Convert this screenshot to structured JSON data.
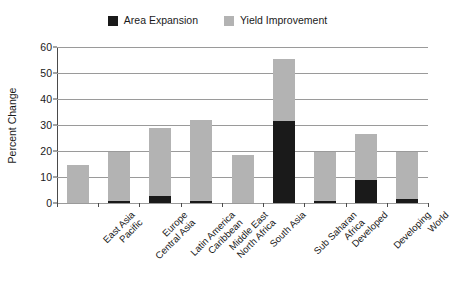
{
  "chart_data": {
    "type": "bar",
    "subtype": "stacked-vertical-bar",
    "title": "",
    "subtitle": "",
    "xlabel": "",
    "ylabel": "Percent Change",
    "ylim": [
      0,
      60
    ],
    "ytick_step": 10,
    "ytick_labels": [
      "60",
      "50",
      "40",
      "30",
      "20",
      "10",
      "0"
    ],
    "ytick_values": [
      60,
      50,
      40,
      30,
      20,
      10,
      0
    ],
    "grid": "horizontal",
    "legend_position": "top-center",
    "categories": [
      "East Asia Pacific",
      "Europe Central Asia",
      "Latin America Caribbean",
      "Middle East North Africa",
      "South Asia",
      "Sub Saharan Africa",
      "Developed",
      "Developing",
      "World"
    ],
    "category_lines": [
      [
        "East Asia",
        "Pacific"
      ],
      [
        "Europe",
        "Central Asia"
      ],
      [
        "Latin America",
        "Caribbean"
      ],
      [
        "Middle East",
        "North Africa"
      ],
      [
        "South Asia",
        ""
      ],
      [
        "Sub Saharan",
        "Africa"
      ],
      [
        "Developed",
        ""
      ],
      [
        "Developing",
        ""
      ],
      [
        "World",
        ""
      ]
    ],
    "series": [
      {
        "name": "Area Expansion",
        "color": "#1a1a1a",
        "values": [
          0,
          0.9,
          2.8,
          0.9,
          0,
          31.5,
          0.6,
          8.7,
          1.5
        ]
      },
      {
        "name": "Yield Improvement",
        "color": "#b3b3b3",
        "values": [
          14.8,
          18.9,
          25.9,
          30.9,
          18.6,
          24.0,
          19.2,
          17.8,
          18.3
        ]
      }
    ],
    "totals": [
      14.8,
      19.8,
      28.7,
      31.8,
      18.6,
      55.5,
      19.8,
      26.5,
      19.8
    ]
  },
  "legend": {
    "entries": [
      {
        "label": "Area Expansion",
        "color": "#1a1a1a"
      },
      {
        "label": "Yield Improvement",
        "color": "#b3b3b3"
      }
    ]
  },
  "axes": {
    "y_title": "Percent Change"
  },
  "colors": {
    "area_expansion": "#1a1a1a",
    "yield_improvement": "#b3b3b3",
    "gridline": "#9a9a9a",
    "axis": "#4a4a4a",
    "background": "#ffffff"
  }
}
